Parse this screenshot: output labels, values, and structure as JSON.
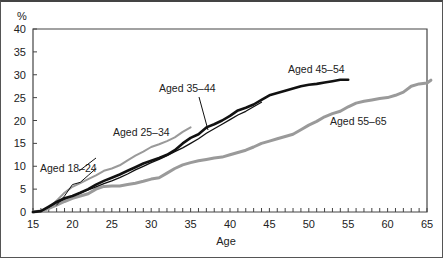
{
  "chart_data": {
    "type": "line",
    "title": "",
    "ylabel": "%",
    "xlabel": "Age",
    "xlim": [
      15,
      65
    ],
    "ylim": [
      0,
      40
    ],
    "x_ticks": [
      15,
      20,
      25,
      30,
      35,
      40,
      45,
      50,
      55,
      60,
      65
    ],
    "y_ticks": [
      0,
      5,
      10,
      15,
      20,
      25,
      30,
      35,
      40
    ],
    "grid": false,
    "legend": "inline labels",
    "series": [
      {
        "name": "Aged 18–24",
        "color": "#111111",
        "width": 1,
        "points": [
          [
            18,
            1.5
          ],
          [
            19,
            3.5
          ],
          [
            20,
            6
          ],
          [
            21,
            6.5
          ],
          [
            22,
            8
          ],
          [
            23,
            9.5
          ]
        ]
      },
      {
        "name": "Aged 25–34",
        "color": "#9a9a9a",
        "width": 2,
        "points": [
          [
            16,
            0
          ],
          [
            17,
            0.8
          ],
          [
            18,
            2.5
          ],
          [
            19,
            4.2
          ],
          [
            20,
            5.5
          ],
          [
            21,
            6.3
          ],
          [
            22,
            7.2
          ],
          [
            23,
            8
          ],
          [
            24,
            9
          ],
          [
            25,
            9.5
          ],
          [
            26,
            10.2
          ],
          [
            27,
            11.3
          ],
          [
            28,
            12.3
          ],
          [
            29,
            13.2
          ],
          [
            30,
            14.2
          ],
          [
            31,
            14.8
          ],
          [
            32,
            15.5
          ],
          [
            33,
            16.3
          ],
          [
            34,
            17.5
          ],
          [
            35,
            18.5
          ]
        ]
      },
      {
        "name": "Aged 35–44",
        "color": "#111111",
        "width": 1.3,
        "points": [
          [
            15,
            0
          ],
          [
            16,
            0.2
          ],
          [
            17,
            1
          ],
          [
            18,
            2
          ],
          [
            19,
            2.8
          ],
          [
            20,
            3.5
          ],
          [
            21,
            4.2
          ],
          [
            22,
            4.8
          ],
          [
            23,
            5.5
          ],
          [
            24,
            6.2
          ],
          [
            25,
            6.8
          ],
          [
            26,
            7.5
          ],
          [
            27,
            8.3
          ],
          [
            28,
            9.2
          ],
          [
            29,
            10
          ],
          [
            30,
            10.8
          ],
          [
            31,
            11.5
          ],
          [
            32,
            12.3
          ],
          [
            33,
            13.2
          ],
          [
            34,
            14
          ],
          [
            35,
            15
          ],
          [
            36,
            16
          ],
          [
            37,
            17.2
          ],
          [
            38,
            18.2
          ],
          [
            39,
            19.2
          ],
          [
            40,
            20.2
          ],
          [
            41,
            21.2
          ],
          [
            42,
            22
          ],
          [
            43,
            23
          ],
          [
            44,
            24
          ]
        ]
      },
      {
        "name": "Aged 45–54",
        "color": "#111111",
        "width": 2.6,
        "points": [
          [
            15,
            0
          ],
          [
            16,
            0.2
          ],
          [
            17,
            1.2
          ],
          [
            18,
            2.2
          ],
          [
            19,
            3
          ],
          [
            20,
            3.5
          ],
          [
            21,
            4.2
          ],
          [
            22,
            5
          ],
          [
            23,
            6
          ],
          [
            24,
            6.8
          ],
          [
            25,
            7.5
          ],
          [
            26,
            8.2
          ],
          [
            27,
            9
          ],
          [
            28,
            9.8
          ],
          [
            29,
            10.6
          ],
          [
            30,
            11.2
          ],
          [
            31,
            11.8
          ],
          [
            32,
            12.5
          ],
          [
            33,
            13.5
          ],
          [
            34,
            15
          ],
          [
            35,
            16.2
          ],
          [
            36,
            17
          ],
          [
            37,
            18.5
          ],
          [
            38,
            19.2
          ],
          [
            39,
            20
          ],
          [
            40,
            21
          ],
          [
            41,
            22.2
          ],
          [
            42,
            22.8
          ],
          [
            43,
            23.5
          ],
          [
            44,
            24.5
          ],
          [
            45,
            25.5
          ],
          [
            46,
            26
          ],
          [
            47,
            26.5
          ],
          [
            48,
            27
          ],
          [
            49,
            27.5
          ],
          [
            50,
            27.8
          ],
          [
            51,
            28
          ],
          [
            52,
            28.3
          ],
          [
            53,
            28.6
          ],
          [
            54,
            28.9
          ],
          [
            55,
            28.9
          ]
        ]
      },
      {
        "name": "Aged 55–65",
        "color": "#9a9a9a",
        "width": 3,
        "points": [
          [
            15,
            0
          ],
          [
            16,
            0.2
          ],
          [
            17,
            0.8
          ],
          [
            18,
            1.5
          ],
          [
            19,
            2.3
          ],
          [
            20,
            3
          ],
          [
            21,
            3.5
          ],
          [
            22,
            4
          ],
          [
            23,
            5
          ],
          [
            24,
            5.6
          ],
          [
            25,
            5.7
          ],
          [
            26,
            5.7
          ],
          [
            27,
            6
          ],
          [
            28,
            6.3
          ],
          [
            29,
            6.7
          ],
          [
            30,
            7.2
          ],
          [
            31,
            7.5
          ],
          [
            32,
            8.5
          ],
          [
            33,
            9.5
          ],
          [
            34,
            10.3
          ],
          [
            35,
            10.8
          ],
          [
            36,
            11.2
          ],
          [
            37,
            11.5
          ],
          [
            38,
            11.8
          ],
          [
            39,
            12
          ],
          [
            40,
            12.5
          ],
          [
            41,
            13
          ],
          [
            42,
            13.5
          ],
          [
            43,
            14.2
          ],
          [
            44,
            15
          ],
          [
            45,
            15.5
          ],
          [
            46,
            16
          ],
          [
            47,
            16.5
          ],
          [
            48,
            17
          ],
          [
            49,
            18
          ],
          [
            50,
            19
          ],
          [
            51,
            19.8
          ],
          [
            52,
            20.8
          ],
          [
            53,
            21.5
          ],
          [
            54,
            22
          ],
          [
            55,
            23
          ],
          [
            56,
            23.8
          ],
          [
            57,
            24.2
          ],
          [
            58,
            24.5
          ],
          [
            59,
            24.8
          ],
          [
            60,
            25
          ],
          [
            61,
            25.5
          ],
          [
            62,
            26.2
          ],
          [
            63,
            27.5
          ],
          [
            64,
            28
          ],
          [
            65,
            28.2
          ],
          [
            65.5,
            28.8
          ]
        ]
      }
    ],
    "annotations": [
      {
        "text": "Aged 18–24",
        "x": 40,
        "y": 172,
        "leader": [
          [
            79,
            171
          ],
          [
            96,
            158
          ]
        ]
      },
      {
        "text": "Aged 25–34",
        "x": 113,
        "y": 136
      },
      {
        "text": "Aged 35–44",
        "x": 159,
        "y": 92,
        "leader": [
          [
            199,
            97
          ],
          [
            208,
            130
          ]
        ]
      },
      {
        "text": "Aged 45–54",
        "x": 288,
        "y": 73
      },
      {
        "text": "Aged 55–65",
        "x": 330,
        "y": 125
      }
    ]
  }
}
